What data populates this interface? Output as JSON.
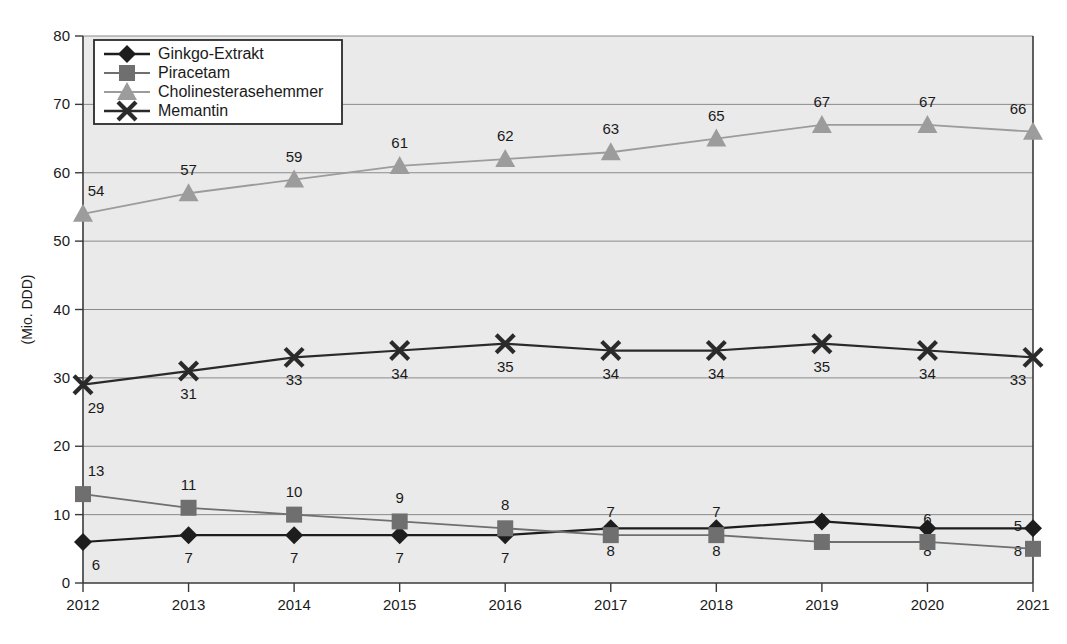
{
  "chart_data": {
    "type": "line",
    "title": "",
    "xlabel": "",
    "ylabel": "(Mio. DDD)",
    "categories": [
      "2012",
      "2013",
      "2014",
      "2015",
      "2016",
      "2017",
      "2018",
      "2019",
      "2020",
      "2021"
    ],
    "ylim": [
      0,
      80
    ],
    "yticks": [
      0,
      10,
      20,
      30,
      40,
      50,
      60,
      70,
      80
    ],
    "grid": true,
    "legend_position": "top-left",
    "data_labels": true,
    "series": [
      {
        "name": "Ginkgo-Extrakt",
        "marker": "diamond",
        "color": "#1d1d1d",
        "label_side": "below",
        "values": [
          6,
          7,
          7,
          7,
          7,
          8,
          8,
          9,
          8,
          8
        ]
      },
      {
        "name": "Piracetam",
        "marker": "square",
        "color": "#6f6f6f",
        "label_side": "above",
        "values": [
          13,
          11,
          10,
          9,
          8,
          7,
          7,
          6,
          6,
          5
        ]
      },
      {
        "name": "Cholinesterasehemmer",
        "marker": "triangle",
        "color": "#9c9c9c",
        "label_side": "above",
        "values": [
          54,
          57,
          59,
          61,
          62,
          63,
          65,
          67,
          67,
          66
        ]
      },
      {
        "name": "Memantin",
        "marker": "cross",
        "color": "#2a2a2a",
        "label_side": "below",
        "values": [
          29,
          31,
          33,
          34,
          35,
          34,
          34,
          35,
          34,
          33
        ]
      }
    ]
  },
  "colors": {
    "plot_background": "#eaeaea",
    "page_background": "#ffffff",
    "axis": "#3a3a3a",
    "gridline": "#8a8a8a",
    "text": "#1a1a1a"
  }
}
